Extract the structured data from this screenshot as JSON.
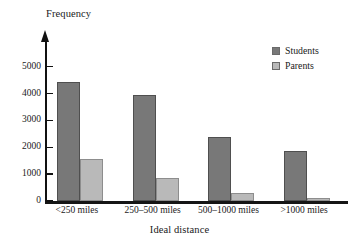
{
  "chart_data": {
    "type": "bar",
    "title": "",
    "xlabel": "Ideal distance",
    "ylabel": "Frequency",
    "categories": [
      "<250 miles",
      "250–500 miles",
      "500–1000 miles",
      ">1000 miles"
    ],
    "series": [
      {
        "name": "Students",
        "color": "#787878",
        "values": [
          4450,
          3950,
          2400,
          1870
        ]
      },
      {
        "name": "Parents",
        "color": "#b9b9b9",
        "values": [
          1550,
          870,
          310,
          120
        ]
      }
    ],
    "ylim": [
      0,
      5400
    ],
    "yticks": [
      0,
      1000,
      2000,
      3000,
      4000,
      5000
    ],
    "ytick_labels": [
      "0",
      "1000",
      "2000",
      "3000",
      "4000",
      "5000"
    ],
    "grid": false,
    "legend_position": "top-right",
    "axis_arrow": true
  },
  "legend": {
    "entries": [
      {
        "label": "Students",
        "color": "#787878"
      },
      {
        "label": "Parents",
        "color": "#b9b9b9"
      }
    ]
  }
}
